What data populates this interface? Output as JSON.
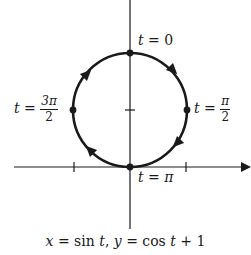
{
  "diagram": {
    "type": "parametric-curve",
    "caption": {
      "x_part": "x",
      "eq1": " = sin ",
      "t1": "t",
      "sep": ", ",
      "y_part": "y",
      "eq2": " = cos ",
      "t2": "t",
      "tail": " + 1"
    },
    "points": [
      {
        "name": "t0",
        "t": "t",
        "eq": " = ",
        "value": "0"
      },
      {
        "name": "t-pi-half",
        "t": "t",
        "eq": " = ",
        "num": "π",
        "den": "2"
      },
      {
        "name": "t-pi",
        "t": "t",
        "eq": " = ",
        "value": "π"
      },
      {
        "name": "t-3pi-half",
        "t": "t",
        "eq": " = ",
        "num": "3π",
        "den": "2"
      }
    ],
    "curve": {
      "center_x": 130,
      "center_y": 110,
      "radius": 57,
      "direction": "clockwise"
    },
    "axes": {
      "x_axis_y": 167,
      "y_axis_x": 130,
      "x_ticks": [
        74,
        186
      ],
      "y_ticks": [
        110
      ]
    },
    "colors": {
      "ink": "#1a1a1a",
      "background": "#ffffff"
    }
  }
}
